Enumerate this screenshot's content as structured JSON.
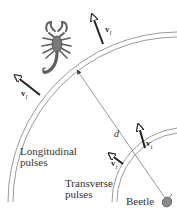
{
  "figure": {
    "labels": {
      "longitudinal_line1": "Longitudinal",
      "longitudinal_line2": "pulses",
      "transverse_line1": "Transverse",
      "transverse_line2": "pulses",
      "beetle": "Beetle",
      "distance": "d"
    },
    "vectors": {
      "v_symbol": "v",
      "longitudinal_sub": "l",
      "transverse_sub": "t"
    },
    "icons": [
      "scorpion-icon",
      "beetle-icon"
    ],
    "colors": {
      "arc": "#9a9a9a",
      "arrow": "#222222",
      "text": "#333333",
      "scorpion": "#6f6f6f"
    }
  }
}
